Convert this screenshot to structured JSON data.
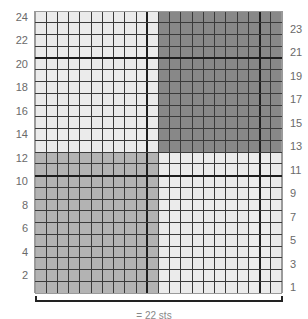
{
  "chart_data": {
    "type": "heatmap",
    "title": "",
    "grid": {
      "columns": 22,
      "rows": 24
    },
    "row_labels_left": [
      "24",
      "22",
      "20",
      "18",
      "16",
      "14",
      "12",
      "10",
      "8",
      "6",
      "4",
      "2"
    ],
    "row_labels_right": [
      "23",
      "21",
      "19",
      "17",
      "15",
      "13",
      "11",
      "9",
      "7",
      "5",
      "3",
      "1"
    ],
    "quadrants": [
      {
        "name": "top-left",
        "cols": [
          1,
          11
        ],
        "rows": [
          13,
          24
        ],
        "shade": "light"
      },
      {
        "name": "top-right",
        "cols": [
          12,
          22
        ],
        "rows": [
          13,
          24
        ],
        "shade": "dark"
      },
      {
        "name": "bottom-left",
        "cols": [
          1,
          11
        ],
        "rows": [
          1,
          12
        ],
        "shade": "medium"
      },
      {
        "name": "bottom-right",
        "cols": [
          12,
          22
        ],
        "rows": [
          1,
          12
        ],
        "shade": "light"
      }
    ],
    "thick_lines": {
      "columns_after": [
        10,
        20
      ],
      "rows_after": [
        10,
        20
      ]
    },
    "colors": {
      "light": "#ebebeb",
      "medium": "#b3b3b3",
      "dark": "#888888",
      "grid": "#3a3a3a"
    },
    "bracket_caption": "= 22 sts"
  }
}
